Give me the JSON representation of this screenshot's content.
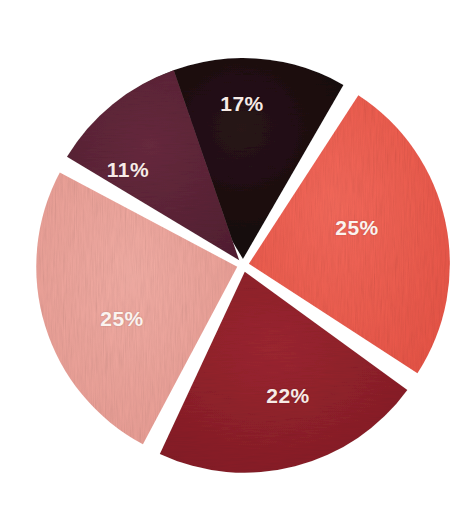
{
  "chart_data": {
    "type": "pie",
    "title": "",
    "subtitle": "",
    "xlabel": "",
    "ylabel": "",
    "legend": "none",
    "grid": false,
    "style": "hand-painted watercolor texture, exploded slices, white background",
    "total_percent": 100,
    "labels_shown": [
      "17%",
      "25%",
      "22%",
      "25%",
      "11%"
    ],
    "categories": [
      "Slice 1",
      "Slice 2",
      "Slice 3",
      "Slice 4",
      "Slice 5"
    ],
    "values": [
      17,
      25,
      22,
      25,
      11
    ],
    "slices": [
      {
        "label": "17%",
        "value": 17,
        "color": "#1b0d11",
        "color_name": "near-black",
        "position": "top",
        "start_angle_deg": -31,
        "end_angle_deg": 30,
        "explode": 6,
        "label_x": 242,
        "label_y": 104,
        "label_on_dark": true
      },
      {
        "label": "25%",
        "value": 25,
        "color": "#ef5b4d",
        "color_name": "coral-red",
        "position": "right",
        "start_angle_deg": 33,
        "end_angle_deg": 123,
        "explode": 6,
        "label_x": 357,
        "label_y": 228,
        "label_on_dark": false
      },
      {
        "label": "22%",
        "value": 22,
        "color": "#8f1f29",
        "color_name": "deep-crimson",
        "position": "bottom",
        "start_angle_deg": 126,
        "end_angle_deg": 205,
        "explode": 7,
        "label_x": 288,
        "label_y": 396,
        "label_on_dark": true
      },
      {
        "label": "25%",
        "value": 25,
        "color": "#eda39a",
        "color_name": "light-pink",
        "position": "left",
        "start_angle_deg": 208,
        "end_angle_deg": 298,
        "explode": 6,
        "label_x": 122,
        "label_y": 319,
        "label_on_dark": false
      },
      {
        "label": "11%",
        "value": 11,
        "color": "#5d2437",
        "color_name": "dark-maroon-wine",
        "position": "upper-left",
        "start_angle_deg": 301,
        "end_angle_deg": 341,
        "explode": 6,
        "label_x": 128,
        "label_y": 170,
        "label_on_dark": true
      }
    ],
    "geometry": {
      "center_x": 243,
      "center_y": 265,
      "radius": 201,
      "gap_color": "#ffffff",
      "gap_width_px": 9
    },
    "background_color": "#ffffff",
    "label_text_color": "#f9f0eb"
  }
}
